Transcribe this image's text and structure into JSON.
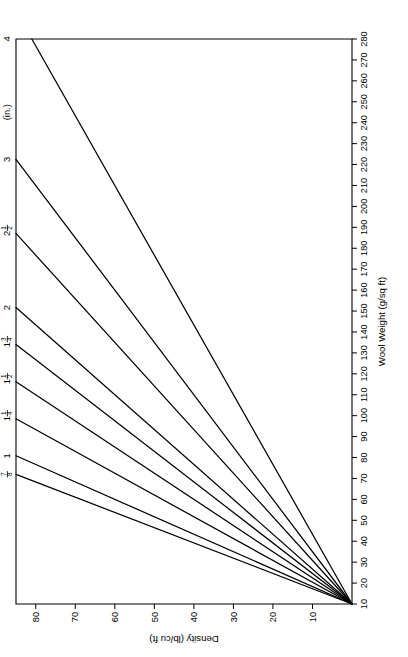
{
  "chart_data": {
    "type": "line",
    "title": "",
    "xlabel": "Wool Weight (g/sq ft)",
    "ylabel": "Density (lb/cu ft)",
    "xlim": [
      10,
      280
    ],
    "ylim": [
      0,
      85
    ],
    "grid": false,
    "legend_position": "line-end-labels",
    "legend_units": "(in.)",
    "xticks": [
      10,
      20,
      30,
      40,
      50,
      60,
      70,
      80,
      90,
      100,
      110,
      120,
      130,
      140,
      150,
      160,
      170,
      180,
      190,
      200,
      210,
      220,
      230,
      240,
      250,
      260,
      270,
      280
    ],
    "xticklabels": [
      "10",
      "20",
      "30",
      "40",
      "50",
      "60",
      "70",
      "80",
      "90",
      "100",
      "110",
      "120",
      "130",
      "140",
      "150",
      "160",
      "170",
      "180",
      "190",
      "200",
      "210",
      "220",
      "230",
      "240",
      "250",
      "260",
      "270",
      "280"
    ],
    "yticks": [
      10,
      20,
      30,
      40,
      50,
      60,
      70,
      80
    ],
    "yticklabels": [
      "10",
      "20",
      "30",
      "40",
      "50",
      "60",
      "70",
      "80"
    ],
    "origin": {
      "x": 10,
      "y": 0
    },
    "series": [
      {
        "name": "7/8",
        "label_whole": "",
        "label_num": "7",
        "label_den": "8",
        "thickness_in": 0.875,
        "slope_lb_per_cuft_per_gsqft": 1.3714,
        "x": [
          10,
          72
        ],
        "y": [
          0,
          85.0
        ]
      },
      {
        "name": "1",
        "label_whole": "1",
        "label_num": "",
        "label_den": "",
        "thickness_in": 1.0,
        "slope_lb_per_cuft_per_gsqft": 1.2,
        "x": [
          10,
          81
        ],
        "y": [
          0,
          85.0
        ]
      },
      {
        "name": "1 1/4",
        "label_whole": "1",
        "label_num": "1",
        "label_den": "4",
        "thickness_in": 1.25,
        "slope_lb_per_cuft_per_gsqft": 0.96,
        "x": [
          10,
          99
        ],
        "y": [
          0,
          85.0
        ]
      },
      {
        "name": "1 1/2",
        "label_whole": "1",
        "label_num": "1",
        "label_den": "2",
        "thickness_in": 1.5,
        "slope_lb_per_cuft_per_gsqft": 0.8,
        "x": [
          10,
          116
        ],
        "y": [
          0,
          85.0
        ]
      },
      {
        "name": "1 3/4",
        "label_whole": "1",
        "label_num": "3",
        "label_den": "4",
        "thickness_in": 1.75,
        "slope_lb_per_cuft_per_gsqft": 0.6857,
        "x": [
          10,
          134
        ],
        "y": [
          0,
          85.0
        ]
      },
      {
        "name": "2",
        "label_whole": "2",
        "label_num": "",
        "label_den": "",
        "thickness_in": 2.0,
        "slope_lb_per_cuft_per_gsqft": 0.6,
        "x": [
          10,
          152
        ],
        "y": [
          0,
          85.0
        ]
      },
      {
        "name": "2 1/2",
        "label_whole": "2",
        "label_num": "1",
        "label_den": "2",
        "thickness_in": 2.5,
        "slope_lb_per_cuft_per_gsqft": 0.48,
        "x": [
          10,
          187
        ],
        "y": [
          0,
          85.0
        ]
      },
      {
        "name": "3",
        "label_whole": "3",
        "label_num": "",
        "label_den": "",
        "thickness_in": 3.0,
        "slope_lb_per_cuft_per_gsqft": 0.4,
        "x": [
          10,
          222
        ],
        "y": [
          0,
          85.0
        ]
      },
      {
        "name": "4",
        "label_whole": "4",
        "label_num": "",
        "label_den": "",
        "thickness_in": 4.0,
        "slope_lb_per_cuft_per_gsqft": 0.3,
        "x": [
          10,
          293
        ],
        "y": [
          0,
          85.0
        ]
      }
    ]
  }
}
